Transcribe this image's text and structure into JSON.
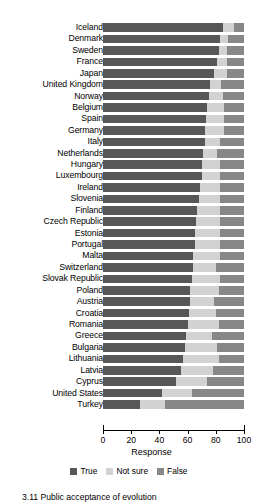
{
  "chart_data": {
    "type": "bar",
    "orientation": "horizontal",
    "stacked": true,
    "title": "",
    "xlabel": "Response",
    "ylabel": "",
    "xlim": [
      0,
      100
    ],
    "xticks": [
      0,
      20,
      40,
      60,
      80,
      100
    ],
    "grid": false,
    "legend_position": "bottom",
    "colors": {
      "True": "#575757",
      "Not sure": "#d2d2d2",
      "False": "#878787",
      "axis": "#000000",
      "background": "#ffffff"
    },
    "legend": [
      "True",
      "Not sure",
      "False"
    ],
    "categories": [
      "Iceland",
      "Denmark",
      "Sweden",
      "France",
      "Japan",
      "United Kingdom",
      "Norway",
      "Belgium",
      "Spain",
      "Germany",
      "Italy",
      "Netherlands",
      "Hungary",
      "Luxembourg",
      "Ireland",
      "Slovenia",
      "Finland",
      "Czech Republic",
      "Estonia",
      "Portugal",
      "Malta",
      "Switzerland",
      "Slovak Republic",
      "Poland",
      "Austria",
      "Croatia",
      "Romania",
      "Greece",
      "Bulgaria",
      "Lithuania",
      "Latvia",
      "Cyprus",
      "United States",
      "Turkey"
    ],
    "series": [
      {
        "name": "True",
        "values": [
          85,
          83,
          82,
          81,
          79,
          76,
          75,
          74,
          73,
          72,
          72,
          71,
          70,
          70,
          69,
          68,
          67,
          66,
          65,
          65,
          64,
          64,
          63,
          62,
          62,
          61,
          60,
          59,
          58,
          57,
          55,
          52,
          42,
          26
        ]
      },
      {
        "name": "Not sure",
        "values": [
          8,
          6,
          6,
          7,
          9,
          8,
          10,
          12,
          13,
          14,
          11,
          10,
          13,
          13,
          14,
          15,
          16,
          17,
          18,
          18,
          19,
          16,
          20,
          20,
          17,
          19,
          22,
          18,
          23,
          25,
          23,
          22,
          21,
          18
        ]
      },
      {
        "name": "False",
        "values": [
          7,
          11,
          12,
          12,
          12,
          16,
          15,
          14,
          14,
          14,
          17,
          19,
          17,
          17,
          17,
          17,
          17,
          17,
          17,
          17,
          17,
          20,
          17,
          18,
          21,
          20,
          18,
          23,
          19,
          18,
          22,
          26,
          37,
          56
        ]
      }
    ]
  },
  "axis": {
    "x_title": "Response",
    "tick_labels": [
      "0",
      "20",
      "40",
      "60",
      "80",
      "100"
    ]
  },
  "caption": {
    "text": "3.11  Public acceptance of evolution"
  }
}
